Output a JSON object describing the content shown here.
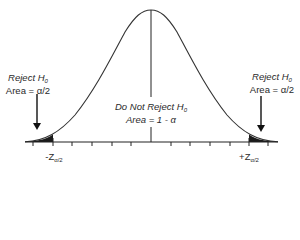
{
  "figure": {
    "left_region": {
      "title": "Reject H",
      "title_sub": "0",
      "area": "Area = α/2"
    },
    "right_region": {
      "title": "Reject H",
      "title_sub": "0",
      "area": "Area = α/2"
    },
    "center_region": {
      "title": "Do Not Reject H",
      "title_sub": "0",
      "area": "Area = 1 - α"
    },
    "critical_values": {
      "left": "-Z",
      "left_sub": "α/2",
      "right": "+Z",
      "right_sub": "α/2"
    },
    "colors": {
      "curve": "#333333",
      "axis": "#222222",
      "shading": "#1a1a1a",
      "text": "#2a2a2a"
    }
  }
}
